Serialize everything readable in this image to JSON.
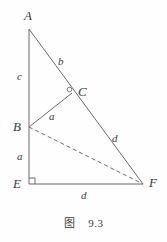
{
  "figure": {
    "caption": "图    9.3",
    "stroke_color": "#6a6a6a",
    "text_color": "#3a3a3a",
    "background": "#fefefe",
    "vertices": [
      {
        "name": "A",
        "label": "A",
        "x": 29,
        "y": 29,
        "label_x": 24,
        "label_y": 9
      },
      {
        "name": "B",
        "label": "B",
        "x": 29,
        "y": 127,
        "label_x": 13,
        "label_y": 120
      },
      {
        "name": "C",
        "label": "C",
        "x": 71,
        "y": 92,
        "label_x": 78,
        "label_y": 85
      },
      {
        "name": "E",
        "label": "E",
        "x": 29,
        "y": 184,
        "label_x": 13,
        "label_y": 177
      },
      {
        "name": "F",
        "label": "F",
        "x": 143,
        "y": 184,
        "label_x": 149,
        "label_y": 176
      }
    ],
    "segments": [
      {
        "name": "segment-AE",
        "from": "A",
        "to": "E",
        "style": "solid"
      },
      {
        "name": "segment-AF",
        "from": "A",
        "to": "F",
        "style": "solid"
      },
      {
        "name": "segment-EF",
        "from": "E",
        "to": "F",
        "style": "solid"
      },
      {
        "name": "segment-BC",
        "from": "B",
        "to": "C",
        "style": "solid"
      },
      {
        "name": "segment-BF",
        "from": "B",
        "to": "F",
        "style": "dashed"
      }
    ],
    "side_labels": [
      {
        "name": "label-b-on-AC",
        "text": "b",
        "x": 58,
        "y": 56
      },
      {
        "name": "label-c-on-AB",
        "text": "c",
        "x": 17,
        "y": 71
      },
      {
        "name": "label-a-on-BC",
        "text": "a",
        "x": 49,
        "y": 111
      },
      {
        "name": "label-a-on-BE",
        "text": "a",
        "x": 17,
        "y": 151
      },
      {
        "name": "label-d-on-CF",
        "text": "d",
        "x": 112,
        "y": 133
      },
      {
        "name": "label-d-on-EF",
        "text": "d",
        "x": 81,
        "y": 190
      }
    ],
    "markers": [
      {
        "name": "right-angle-marker-E",
        "type": "square",
        "x": 29,
        "y": 184,
        "size": 5
      },
      {
        "name": "perpendicular-marker-C",
        "type": "circle",
        "x": 69,
        "y": 89,
        "r": 2.2
      }
    ]
  }
}
